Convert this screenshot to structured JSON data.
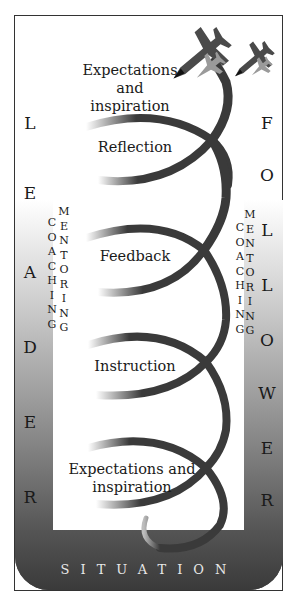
{
  "diagram": {
    "left_word": "LEADER",
    "left_letters": [
      "L",
      "E",
      "A",
      "D",
      "E",
      "R"
    ],
    "right_word": "FOLLOWER",
    "right_letters": [
      "F",
      "O",
      "L",
      "L",
      "O",
      "W",
      "E",
      "R"
    ],
    "bottom_label": "SITUATION",
    "left_columns": {
      "coaching": [
        "C",
        "O",
        "A",
        "C",
        "H",
        "I",
        "N",
        "G"
      ],
      "mentoring": [
        "M",
        "E",
        "N",
        "T",
        "O",
        "R",
        "I",
        "N",
        "G"
      ]
    },
    "right_columns": {
      "coaching": [
        "C",
        "O",
        "A",
        "C",
        "H",
        "I",
        "N",
        "G"
      ],
      "mentoring": [
        "M",
        "E",
        "N",
        "T",
        "O",
        "R",
        "I",
        "N",
        "G"
      ]
    },
    "stages": [
      {
        "label": "Expectations and inspiration",
        "position": "top"
      },
      {
        "label": "Reflection"
      },
      {
        "label": "Feedback"
      },
      {
        "label": "Instruction"
      },
      {
        "label": "Expectations and inspiration",
        "position": "bottom"
      }
    ],
    "top_stage_lines": [
      "Expectations",
      "and",
      "inspiration"
    ],
    "bottom_stage_lines": [
      "Expectations and",
      "inspiration"
    ],
    "icons": [
      "fighter-jet-large-icon",
      "fighter-jet-small-icon"
    ],
    "colors": {
      "spiral": "#3a3a3a",
      "band_dark": "#3a3a3a",
      "band_light": "#d0d0d0",
      "jet_dark": "#4a4a4a",
      "jet_light": "#9a9a9a",
      "situation_text": "#e8e8e8"
    }
  }
}
